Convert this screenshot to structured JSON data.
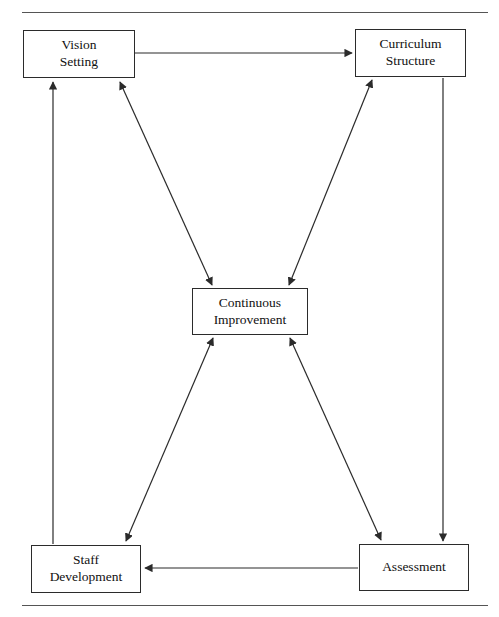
{
  "figure": {
    "type": "flow-diagram",
    "width": 499,
    "height": 617,
    "background_color": "#ffffff",
    "line_color": "#2b2b2b",
    "rule_color": "#555555",
    "text_color": "#111111"
  },
  "rules": [
    {
      "name": "top-rule",
      "x": 22,
      "y": 12,
      "width": 466
    },
    {
      "name": "bottom-rule",
      "x": 22,
      "y": 605,
      "width": 466
    }
  ],
  "nodes": [
    {
      "id": "vision-setting",
      "label": "Vision\nSetting",
      "x": 23,
      "y": 30,
      "width": 112,
      "height": 48
    },
    {
      "id": "curriculum-structure",
      "label": "Curriculum\nStructure",
      "x": 355,
      "y": 29,
      "width": 111,
      "height": 48
    },
    {
      "id": "continuous-improvement",
      "label": "Continuous\nImprovement",
      "x": 192,
      "y": 288,
      "width": 116,
      "height": 47
    },
    {
      "id": "staff-development",
      "label": "Staff\nDevelopment",
      "x": 31,
      "y": 545,
      "width": 110,
      "height": 48
    },
    {
      "id": "assessment",
      "label": "Assessment",
      "x": 359,
      "y": 544,
      "width": 110,
      "height": 47
    }
  ],
  "edges": [
    {
      "id": "vision-to-curriculum",
      "from": "vision-setting",
      "to": "curriculum-structure",
      "direction": "one-way",
      "points": "135,53 352,53"
    },
    {
      "id": "curriculum-to-assessment",
      "from": "curriculum-structure",
      "to": "assessment",
      "direction": "one-way",
      "points": "443,78 443,541"
    },
    {
      "id": "assessment-to-staff",
      "from": "assessment",
      "to": "staff-development",
      "direction": "one-way",
      "points": "358,568 145,568"
    },
    {
      "id": "staff-to-vision",
      "from": "staff-development",
      "to": "vision-setting",
      "direction": "one-way",
      "points": "53,544 53,82"
    },
    {
      "id": "vision-improvement",
      "from": "vision-setting",
      "to": "continuous-improvement",
      "direction": "two-way",
      "points": "120,82 212,285"
    },
    {
      "id": "curriculum-improvement",
      "from": "curriculum-structure",
      "to": "continuous-improvement",
      "direction": "two-way",
      "points": "372,80 289,285"
    },
    {
      "id": "staff-improvement",
      "from": "staff-development",
      "to": "continuous-improvement",
      "direction": "two-way",
      "points": "126,541 213,338"
    },
    {
      "id": "assessment-improvement",
      "from": "assessment",
      "to": "continuous-improvement",
      "direction": "two-way",
      "points": "381,540 290,338"
    }
  ]
}
